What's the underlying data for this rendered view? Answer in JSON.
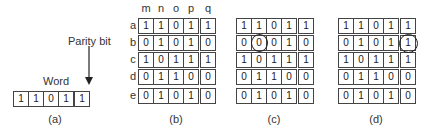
{
  "figure_a": {
    "parity_label": "Parity bit",
    "word_label": "Word",
    "bits": [
      "1",
      "1",
      "0",
      "1",
      "1"
    ],
    "caption": "(a)"
  },
  "column_labels": [
    "m",
    "n",
    "o",
    "p",
    "q"
  ],
  "row_labels": [
    "a",
    "b",
    "c",
    "d",
    "e"
  ],
  "figure_b": {
    "caption": "(b)",
    "rows": [
      [
        "1",
        "1",
        "0",
        "1",
        "1"
      ],
      [
        "0",
        "1",
        "0",
        "1",
        "0"
      ],
      [
        "1",
        "0",
        "1",
        "1",
        "1"
      ],
      [
        "0",
        "1",
        "1",
        "0",
        "0"
      ],
      [
        "0",
        "1",
        "0",
        "1",
        "0"
      ]
    ]
  },
  "figure_c": {
    "caption": "(c)",
    "circled_cell": {
      "row": 1,
      "col": 1
    },
    "rows": [
      [
        "1",
        "1",
        "0",
        "1",
        "1"
      ],
      [
        "0",
        "0",
        "0",
        "1",
        "0"
      ],
      [
        "1",
        "0",
        "1",
        "1",
        "1"
      ],
      [
        "0",
        "1",
        "1",
        "0",
        "0"
      ],
      [
        "0",
        "1",
        "0",
        "1",
        "0"
      ]
    ]
  },
  "figure_d": {
    "caption": "(d)",
    "circled_cell": {
      "row": 1,
      "col": 4
    },
    "rows": [
      [
        "1",
        "1",
        "0",
        "1",
        "1"
      ],
      [
        "0",
        "1",
        "0",
        "1",
        "1"
      ],
      [
        "1",
        "0",
        "1",
        "1",
        "1"
      ],
      [
        "0",
        "1",
        "1",
        "0",
        "0"
      ],
      [
        "0",
        "1",
        "0",
        "1",
        "0"
      ]
    ]
  }
}
